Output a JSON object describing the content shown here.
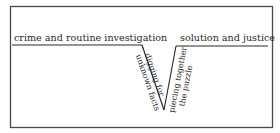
{
  "diagram": {
    "type": "plot-structure-v",
    "stages": {
      "start_label": "crime and routine investigation",
      "descent_line1": "digging for",
      "descent_line2": "unknown facts",
      "ascent_line1": "piecing together",
      "ascent_line2": "the puzzle",
      "end_label": "solution and justice"
    },
    "colors": {
      "line": "#2a2a2a",
      "frame": "#4a4a4a",
      "background": "#ffffff"
    }
  }
}
